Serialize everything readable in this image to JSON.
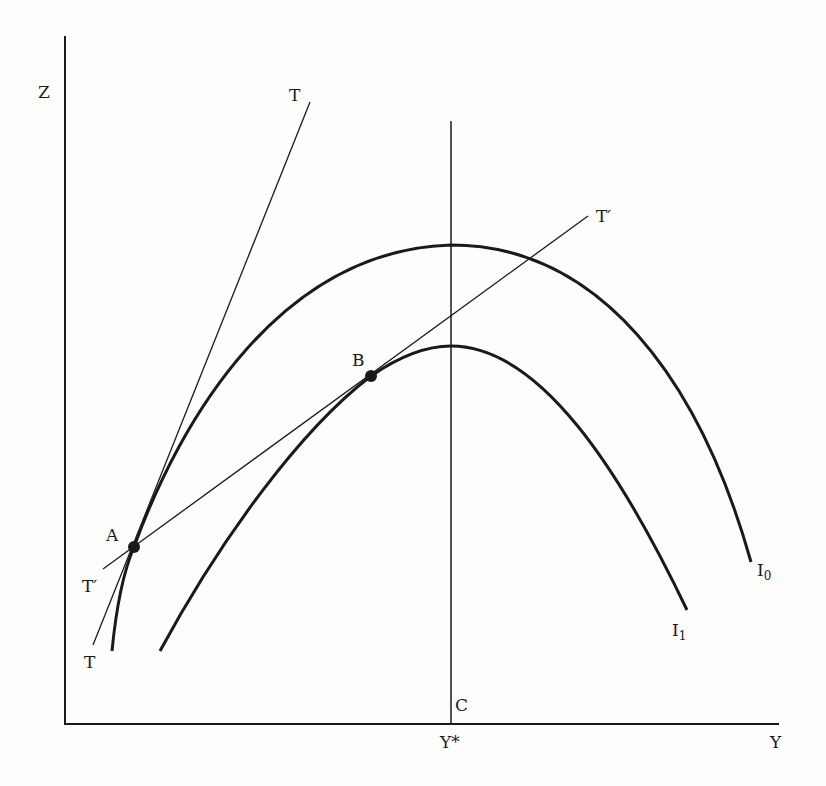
{
  "diagram": {
    "type": "economic diagram — indifference curves with tangent lines",
    "axes": {
      "vertical_label": "Z",
      "horizontal_label": "Y"
    },
    "vertical_line": {
      "top_label": "C",
      "bottom_label": "Y*"
    },
    "curves": [
      {
        "id": "I0",
        "label_main": "I",
        "label_sub": "0"
      },
      {
        "id": "I1",
        "label_main": "I",
        "label_sub": "1"
      }
    ],
    "tangent_lines": [
      {
        "id": "T",
        "label_top": "T",
        "label_bottom": "T"
      },
      {
        "id": "T-prime",
        "label_top": "T′",
        "label_bottom": "T′"
      }
    ],
    "points": [
      {
        "id": "A",
        "label": "A"
      },
      {
        "id": "B",
        "label": "B"
      }
    ],
    "colors": {
      "ink": "#1a1a1a",
      "background": "#fdfdfc"
    }
  }
}
